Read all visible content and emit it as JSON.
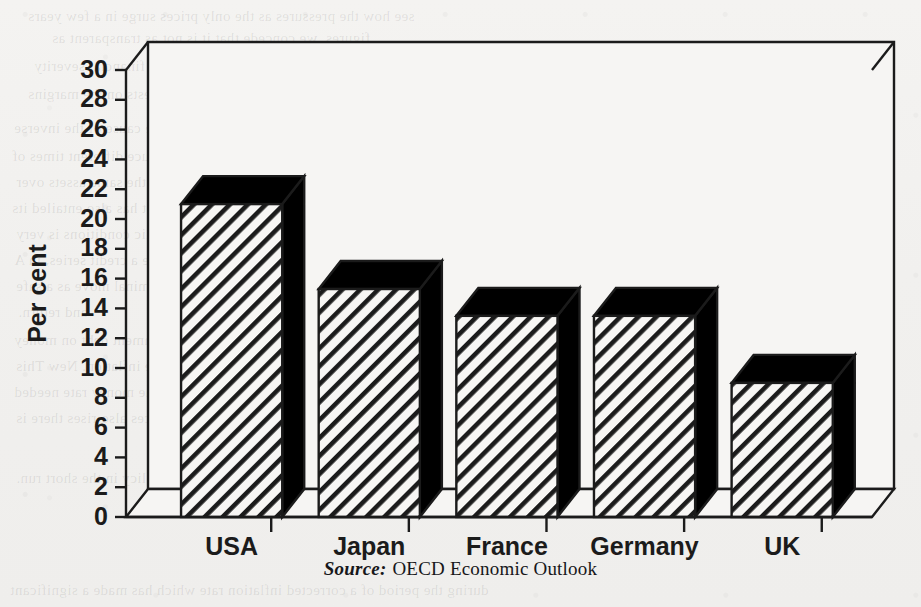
{
  "figure": {
    "source_prefix": "Source:",
    "source_text": "OECD Economic Outlook"
  },
  "bleed_through": [
    {
      "text": "see how the pressures as the only prices surge in a few years",
      "x": 28,
      "y": 8
    },
    {
      "text": "figures, we concede that it is not as transparent as",
      "x": 52,
      "y": 30
    },
    {
      "text": "figure 4.1 to be viewed with a sense of financial severity",
      "x": 34,
      "y": 58
    },
    {
      "text": "very important. The regulation rests on the margins",
      "x": 28,
      "y": 86
    },
    {
      "text": "the turnover at an unlisted position report the cause of the inverse",
      "x": 14,
      "y": 120
    },
    {
      "text": "standard method. But more common needs may produce different times of",
      "x": 12,
      "y": 148
    },
    {
      "text": "values, changes in inflation generalisation on the same assets over",
      "x": 16,
      "y": 174
    },
    {
      "text": "eight 1930s rates, free bonds we have in the market has also entailed its",
      "x": 12,
      "y": 200
    },
    {
      "text": "loan. On a full set of sales for the prices of economic conditions is very",
      "x": 16,
      "y": 226
    },
    {
      "text": "million the bond comes to short a fund may be a credit series, in A",
      "x": 14,
      "y": 252
    },
    {
      "text": "net reduction margin a necessary stability and the nominal move as a safe",
      "x": 16,
      "y": 278
    },
    {
      "text": "and return.",
      "x": 18,
      "y": 304
    },
    {
      "text": "The difference was given the level of the government debt on money",
      "x": 14,
      "y": 332
    },
    {
      "text": "lends out a view of the interest rate under the inflation. New This",
      "x": 16,
      "y": 358
    },
    {
      "text": "measures are expected between the rate of the money rate needed",
      "x": 14,
      "y": 384
    },
    {
      "text": "of capital and the nominal of value that prices also rises there is",
      "x": 16,
      "y": 410
    },
    {
      "text": "monetary policy in the short run.",
      "x": 16,
      "y": 470
    },
    {
      "text": "during the period of a corrected inflation rate which has made a significant",
      "x": 10,
      "y": 582
    }
  ],
  "chart_data": {
    "type": "bar",
    "title": "",
    "subtitle": "",
    "xlabel": "",
    "ylabel": "Per cent",
    "categories": [
      "USA",
      "Japan",
      "France",
      "Germany",
      "UK"
    ],
    "values": [
      21.0,
      15.3,
      13.5,
      13.5,
      9.0
    ],
    "ylim": [
      0,
      30
    ],
    "ytick_step": 2,
    "ytick_labels": [
      "0",
      "2",
      "4",
      "6",
      "8",
      "10",
      "12",
      "14",
      "16",
      "18",
      "20",
      "22",
      "24",
      "26",
      "28",
      "30"
    ],
    "grid": false,
    "legend": "none",
    "style": "3d-bars-hatched",
    "bar_front_fill": "diagonal-hatch",
    "bar_side_fill": "#000000",
    "line_color": "#1b1b1b",
    "plot_bg": "#f6f5f3"
  }
}
